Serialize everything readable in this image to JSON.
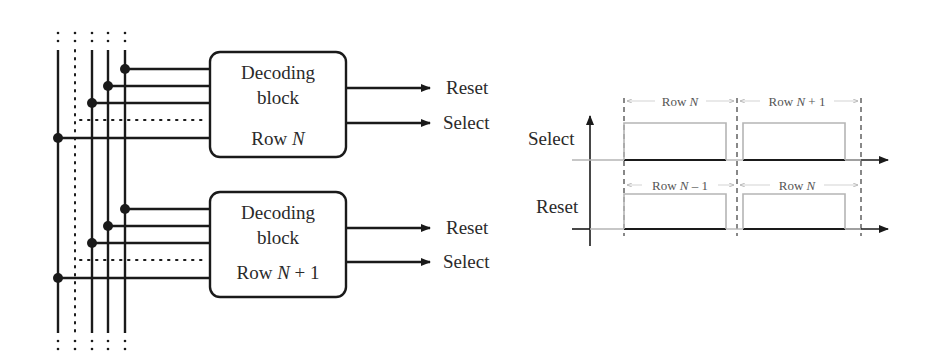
{
  "decoder": {
    "blocks": [
      {
        "title_line1": "Decoding",
        "title_line2": "block",
        "row_prefix": "Row ",
        "row_var": "N",
        "row_suffix": "",
        "outputs": [
          "Reset",
          "Select"
        ]
      },
      {
        "title_line1": "Decoding",
        "title_line2": "block",
        "row_prefix": "Row ",
        "row_var": "N",
        "row_suffix": " + 1",
        "outputs": [
          "Reset",
          "Select"
        ]
      }
    ]
  },
  "timing": {
    "signals": [
      {
        "name": "Select",
        "pulses": [
          {
            "prefix": "Row ",
            "var": "N",
            "suffix": ""
          },
          {
            "prefix": "Row ",
            "var": "N",
            "suffix": " + 1"
          }
        ]
      },
      {
        "name": "Reset",
        "pulses": [
          {
            "prefix": "Row ",
            "var": "N",
            "suffix": " – 1"
          },
          {
            "prefix": "Row ",
            "var": "N",
            "suffix": ""
          }
        ]
      }
    ]
  },
  "colors": {
    "line": "#1a1a1a",
    "pulse": "#b5b5b5",
    "dim": "#c8c8c8",
    "dashed": "#3a3a3a"
  }
}
